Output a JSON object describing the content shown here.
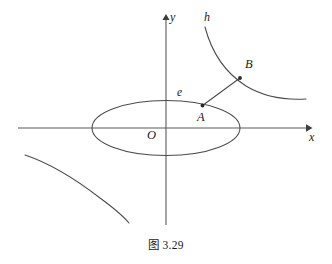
{
  "figure": {
    "caption": "图 3.29",
    "background_color": "#ffffff",
    "stroke_color": "#4a4a4a",
    "text_color": "#1a1a1a",
    "width": 332,
    "height": 264
  },
  "axes": {
    "x_axis": {
      "label": "x",
      "y": 128,
      "x_start": 18,
      "x_end": 308,
      "arrow": "right"
    },
    "y_axis": {
      "label": "y",
      "x": 166,
      "y_start": 225,
      "y_end": 17,
      "arrow": "up"
    },
    "origin": {
      "label": "O",
      "x": 166,
      "y": 128
    }
  },
  "curves": {
    "ellipse": {
      "name": "e",
      "label": "e",
      "center_x": 166,
      "center_y": 128,
      "semi_axis_x": 74,
      "semi_axis_y": 27.5
    },
    "hyperbola": {
      "name": "h",
      "label": "h",
      "upper_right_branch": "M 205,27 C 212,52 226,74 248,88 C 268,99 290,100 306,99",
      "lower_left_branch": "M 25,155 C 50,164 80,183 102,200 C 116,211 124,218 129,223"
    }
  },
  "points": [
    {
      "label": "A",
      "x": 202,
      "y": 106,
      "on_curve": "ellipse"
    },
    {
      "label": "B",
      "x": 240,
      "y": 78,
      "on_curve": "hyperbola"
    }
  ],
  "segments": [
    {
      "name": "segment-AB",
      "from": "A",
      "to": "B",
      "x1": 202,
      "y1": 106,
      "x2": 240,
      "y2": 78
    }
  ]
}
